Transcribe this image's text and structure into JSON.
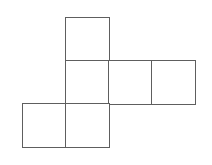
{
  "diagram": {
    "type": "cube-net",
    "cell_size": 43,
    "origin": {
      "x": 23,
      "y": 18
    },
    "line_color": "#5e5e5e",
    "background": "#ffffff",
    "faces": [
      {
        "id": "face-1",
        "row": 0,
        "col": 1
      },
      {
        "id": "face-2",
        "row": 1,
        "col": 1
      },
      {
        "id": "face-3",
        "row": 1,
        "col": 2
      },
      {
        "id": "face-4",
        "row": 1,
        "col": 3
      },
      {
        "id": "face-5",
        "row": 2,
        "col": 0
      },
      {
        "id": "face-6",
        "row": 2,
        "col": 1
      }
    ]
  }
}
